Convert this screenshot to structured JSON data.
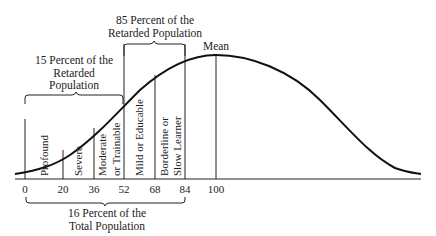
{
  "diagram": {
    "type": "normal-distribution-iq",
    "mean_label": "Mean",
    "axis_ticks": [
      "0",
      "20",
      "36",
      "52",
      "68",
      "84",
      "100"
    ],
    "categories": [
      {
        "line1": "Profound",
        "line2": ""
      },
      {
        "line1": "Severe",
        "line2": ""
      },
      {
        "line1": "Moderate",
        "line2": "or Trainable"
      },
      {
        "line1": "Mild or Educable",
        "line2": ""
      },
      {
        "line1": "Borderline or",
        "line2": "Slow Learner"
      }
    ],
    "brackets": {
      "upper_right": {
        "line1": "85 Percent of the",
        "line2": "Retarded Population"
      },
      "upper_left": {
        "line1": "15 Percent of the",
        "line2": "Retarded",
        "line3": "Population"
      },
      "bottom": {
        "line1": "16 Percent of the",
        "line2": "Total Population"
      }
    }
  }
}
